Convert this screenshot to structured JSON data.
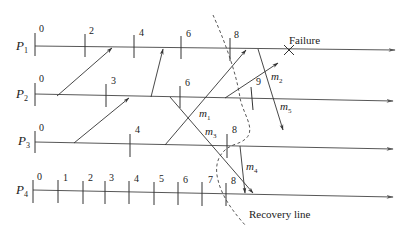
{
  "diagram": {
    "processes": [
      {
        "name": "P",
        "sub": "1",
        "y": 46,
        "checkpoints": [
          {
            "label": "0",
            "x": 35
          },
          {
            "label": "2",
            "x": 85
          },
          {
            "label": "4",
            "x": 134
          },
          {
            "label": "6",
            "x": 181
          },
          {
            "label": "8",
            "x": 230
          }
        ]
      },
      {
        "name": "P",
        "sub": "2",
        "y": 96,
        "checkpoints": [
          {
            "label": "0",
            "x": 35
          },
          {
            "label": "3",
            "x": 106
          },
          {
            "label": "6",
            "x": 180
          },
          {
            "label": "9",
            "x": 252
          }
        ]
      },
      {
        "name": "P",
        "sub": "3",
        "y": 144,
        "checkpoints": [
          {
            "label": "0",
            "x": 35
          },
          {
            "label": "4",
            "x": 130
          },
          {
            "label": "8",
            "x": 227
          }
        ]
      },
      {
        "name": "P",
        "sub": "4",
        "y": 192,
        "checkpoints": [
          {
            "label": "0",
            "x": 33
          },
          {
            "label": "1",
            "x": 58
          },
          {
            "label": "2",
            "x": 83
          },
          {
            "label": "3",
            "x": 105
          },
          {
            "label": "4",
            "x": 129
          },
          {
            "label": "5",
            "x": 154
          },
          {
            "label": "6",
            "x": 178
          },
          {
            "label": "7",
            "x": 202
          },
          {
            "label": "8",
            "x": 226
          }
        ]
      }
    ],
    "messages": [
      {
        "label": "",
        "sub": ""
      },
      {
        "label": "",
        "sub": ""
      },
      {
        "label": "",
        "sub": ""
      },
      {
        "label": "m",
        "sub": "1"
      },
      {
        "label": "m",
        "sub": "2"
      },
      {
        "label": "m",
        "sub": "3"
      },
      {
        "label": "m",
        "sub": "4"
      },
      {
        "label": "m",
        "sub": "5"
      }
    ],
    "failure_label": "Failure",
    "recovery_line_label": "Recovery line"
  }
}
